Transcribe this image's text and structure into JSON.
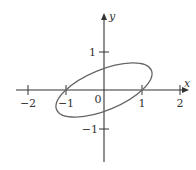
{
  "diagram": {
    "type": "coordinate-plane-with-ellipse",
    "axes": {
      "x_label": "x",
      "y_label": "y",
      "x_ticks": [
        {
          "value": -2,
          "label": "−2"
        },
        {
          "value": -1,
          "label": "−1"
        },
        {
          "value": 1,
          "label": "1"
        },
        {
          "value": 2,
          "label": "2"
        }
      ],
      "y_ticks": [
        {
          "value": 1,
          "label": "1"
        },
        {
          "value": -1,
          "label": "−1"
        }
      ],
      "origin_label": "0",
      "x_range": [
        -2.3,
        2.1
      ],
      "y_range": [
        -1.9,
        2.0
      ]
    },
    "curve": {
      "shape": "ellipse",
      "center": [
        0,
        0
      ],
      "rotation_deg": 22.5,
      "semi_major": 1.35,
      "semi_minor": 0.53,
      "passes_through": [
        [
          -1,
          0
        ],
        [
          1,
          0
        ]
      ]
    },
    "colors": {
      "axes": "#333333",
      "curve": "#666666"
    }
  }
}
